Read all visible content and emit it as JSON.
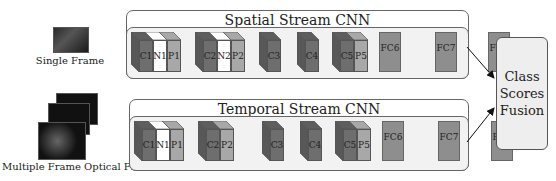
{
  "inputs": {
    "single_frame_label": "Single Frame",
    "optical_flow_label": "Multiple Frame Optical Flow"
  },
  "streams": [
    {
      "title": "Spatial Stream CNN",
      "layers": [
        {
          "type": "cube",
          "faces": [
            "C1",
            "N1",
            "P1"
          ]
        },
        {
          "type": "cube",
          "faces": [
            "C2",
            "N2",
            "P2"
          ]
        },
        {
          "type": "cube",
          "faces": [
            "C3"
          ]
        },
        {
          "type": "cube",
          "faces": [
            "C4"
          ]
        },
        {
          "type": "cube",
          "faces": [
            "C5",
            "P5"
          ]
        },
        {
          "type": "fc",
          "label": "FC6"
        },
        {
          "type": "fc",
          "label": "FC7"
        },
        {
          "type": "fc",
          "label": "FC8"
        }
      ]
    },
    {
      "title": "Temporal Stream CNN",
      "layers": [
        {
          "type": "cube",
          "faces": [
            "C1",
            "N1",
            "P1"
          ]
        },
        {
          "type": "cube",
          "faces": [
            "C2",
            "P2"
          ]
        },
        {
          "type": "cube",
          "faces": [
            "C3"
          ]
        },
        {
          "type": "cube",
          "faces": [
            "C4"
          ]
        },
        {
          "type": "cube",
          "faces": [
            "C5",
            "P5"
          ]
        },
        {
          "type": "fc",
          "label": "FC6"
        },
        {
          "type": "fc",
          "label": "FC7"
        },
        {
          "type": "fc",
          "label": "FC8"
        }
      ]
    }
  ],
  "fusion": {
    "line1": "Class",
    "line2": "Scores",
    "line3": "Fusion"
  },
  "colors": {
    "conv": "#6e6e6e",
    "norm": "#ffffff",
    "pool": "#a8a8a8",
    "fc": "#8e8e8e"
  }
}
